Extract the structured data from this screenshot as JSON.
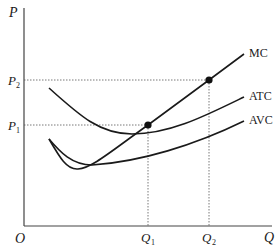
{
  "diagram": {
    "type": "cost-curves",
    "axes": {
      "y_label": "P",
      "x_label": "Q",
      "origin_label": "O"
    },
    "price_levels": [
      {
        "label": "P",
        "sub": "2",
        "y": 80
      },
      {
        "label": "P",
        "sub": "1",
        "y": 125
      }
    ],
    "quantity_levels": [
      {
        "label": "Q",
        "sub": "1",
        "x": 148
      },
      {
        "label": "Q",
        "sub": "2",
        "x": 209
      }
    ],
    "curves": [
      {
        "name": "MC",
        "label": "MC"
      },
      {
        "name": "ATC",
        "label": "ATC"
      },
      {
        "name": "AVC",
        "label": "AVC"
      }
    ],
    "points": [
      {
        "name": "P1Q1",
        "x": 148,
        "y": 125,
        "desc": "MC intersects ATC minimum at (Q1, P1)"
      },
      {
        "name": "P2Q2",
        "x": 209,
        "y": 80,
        "desc": "Point on MC at (Q2, P2)"
      }
    ],
    "colors": {
      "line": "#1a1a1a",
      "guide": "#555555",
      "background": "#ffffff"
    }
  }
}
